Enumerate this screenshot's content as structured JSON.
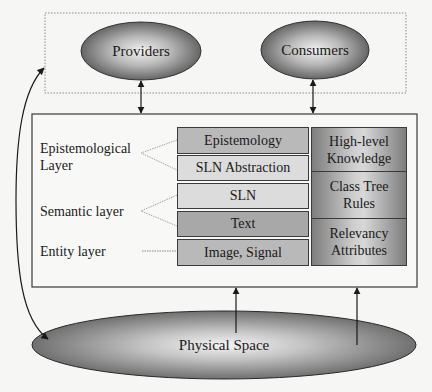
{
  "diagram": {
    "top_group": {
      "border_style": "dotted",
      "nodes": [
        {
          "id": "providers",
          "label": "Providers"
        },
        {
          "id": "consumers",
          "label": "Consumers"
        }
      ]
    },
    "main_box": {
      "layer_labels": [
        {
          "id": "epistemological",
          "line1": "Epistemological",
          "line2": "Layer"
        },
        {
          "id": "semantic",
          "line1": "Semantic layer"
        },
        {
          "id": "entity",
          "line1": "Entity layer"
        }
      ],
      "stack": [
        {
          "label": "Epistemology",
          "shade": "gray"
        },
        {
          "label": "SLN Abstraction",
          "shade": "light"
        },
        {
          "label": "SLN",
          "shade": "light"
        },
        {
          "label": "Text",
          "shade": "dark"
        },
        {
          "label": "Image, Signal",
          "shade": "gray"
        }
      ],
      "knowledge_column": [
        {
          "line1": "High-level",
          "line2": "Knowledge"
        },
        {
          "line1": "Class Tree",
          "line2": "Rules"
        },
        {
          "line1": "Relevancy",
          "line2": "Attributes"
        }
      ]
    },
    "bottom_node": {
      "id": "physical-space",
      "label": "Physical Space"
    },
    "connections": [
      {
        "from": "Providers",
        "to": "main_box",
        "type": "bidirectional"
      },
      {
        "from": "Consumers",
        "to": "main_box",
        "type": "bidirectional"
      },
      {
        "from": "Physical Space",
        "to": "main_box",
        "type": "arrow-up",
        "count": 2
      },
      {
        "from": "Physical Space",
        "to": "top_group",
        "type": "curved-bidirectional"
      }
    ],
    "colors": {
      "background": "#f6f6f4",
      "stroke": "#2a2a2a",
      "ellipse_dark": "#5a5a5a",
      "ellipse_light": "#f0f0f0",
      "cell_gray": "#b9b9b9",
      "cell_light": "#dcdcdc",
      "cell_dark": "#a8a8a8"
    }
  }
}
